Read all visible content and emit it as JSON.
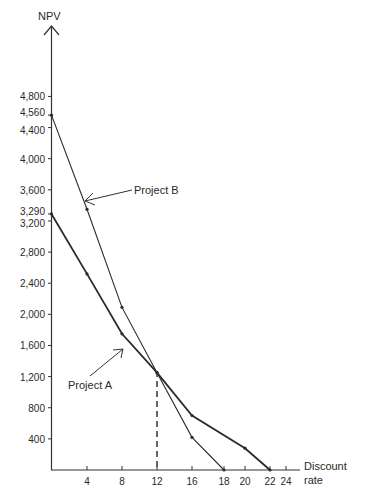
{
  "chart_data": {
    "type": "line",
    "title": "",
    "xlabel": "Discount rate",
    "ylabel": "NPV",
    "x_ticks": [
      4,
      8,
      12,
      16,
      18,
      20,
      22,
      24
    ],
    "y_ticks": [
      400,
      800,
      1200,
      1600,
      2000,
      2400,
      2800,
      3200,
      3290,
      3600,
      4000,
      4400,
      4560,
      4800
    ],
    "y_tick_labels": [
      "400",
      "800",
      "1,200",
      "1,600",
      "2,000",
      "2,400",
      "2,800",
      "3,200",
      "3,290",
      "3,600",
      "4,000",
      "4,400",
      "4,560",
      "4,800"
    ],
    "xlim": [
      0,
      25
    ],
    "ylim": [
      0,
      5000
    ],
    "grid": false,
    "legend": "none (inline annotations)",
    "series": [
      {
        "name": "Project A",
        "x": [
          0,
          4,
          8,
          12,
          16,
          20,
          22
        ],
        "values": [
          3290,
          2520,
          1750,
          1250,
          700,
          280,
          0
        ],
        "style": "thick"
      },
      {
        "name": "Project B",
        "x": [
          0,
          4,
          8,
          12,
          16,
          18
        ],
        "values": [
          4560,
          3350,
          2090,
          1250,
          420,
          0
        ],
        "style": "thin"
      }
    ],
    "annotations": [
      {
        "text": "Project A",
        "points_to": "Project A line near x=8"
      },
      {
        "text": "Project B",
        "points_to": "Project B line near x=4"
      },
      {
        "text": "dashed vertical line",
        "at_x": 12,
        "from_y": 0,
        "to_y": 1250,
        "meaning": "crossover rate"
      }
    ]
  },
  "labels": {
    "y_axis_title": "NPV",
    "x_axis_title_line1": "Discount",
    "x_axis_title_line2": "rate",
    "project_a": "Project A",
    "project_b": "Project B"
  },
  "colors": {
    "axis": "#333333",
    "line": "#2b2b2b",
    "background": "#ffffff"
  }
}
